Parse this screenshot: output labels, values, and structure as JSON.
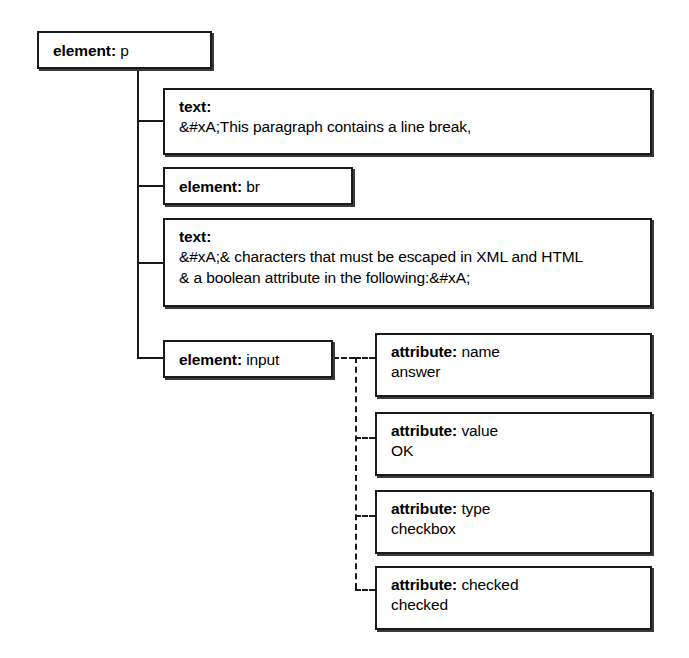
{
  "diagram": {
    "root": {
      "kind": "element:",
      "name": "p"
    },
    "children": [
      {
        "kind": "text:",
        "name": "",
        "lines": [
          "&#xA;This paragraph contains a line break,"
        ]
      },
      {
        "kind": "element:",
        "name": "br",
        "lines": []
      },
      {
        "kind": "text:",
        "name": "",
        "lines": [
          "&#xA;& characters that must be escaped in XML and HTML",
          "& a boolean attribute in the following:&#xA;"
        ]
      },
      {
        "kind": "element:",
        "name": "input",
        "lines": []
      }
    ],
    "attributes": [
      {
        "kind": "attribute:",
        "name": "name",
        "value": "answer"
      },
      {
        "kind": "attribute:",
        "name": "value",
        "value": "OK"
      },
      {
        "kind": "attribute:",
        "name": "type",
        "value": "checkbox"
      },
      {
        "kind": "attribute:",
        "name": "checked",
        "value": "checked"
      }
    ],
    "colors": {
      "stroke": "#1a1a1a",
      "shadow": "#3a3a3a",
      "background": "#ffffff",
      "text": "#000000"
    }
  }
}
